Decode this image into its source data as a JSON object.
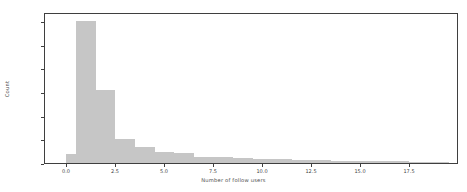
{
  "chart_data": {
    "type": "bar",
    "title": "",
    "subtitle": "",
    "xlabel": "Number of follow users",
    "ylabel": "Count",
    "xlim": [
      -0.95,
      19.8
    ],
    "ylim": [
      0,
      127000
    ],
    "grid": false,
    "legend": null,
    "bin_width": 0.5,
    "bar_color": "#c6c6c6",
    "frame_color": "#3f3f3f",
    "x_ticks": [
      "0.0",
      "2.5",
      "5.0",
      "7.5",
      "10.0",
      "12.5",
      "15.0",
      "17.5"
    ],
    "x_tick_values": [
      0.0,
      2.5,
      5.0,
      7.5,
      10.0,
      12.5,
      15.0,
      17.5
    ],
    "y_ticks": [
      "0",
      "20000",
      "40000",
      "60000",
      "80000",
      "100000",
      "120000"
    ],
    "y_tick_values": [
      0,
      20000,
      40000,
      60000,
      80000,
      100000,
      120000
    ],
    "bins": [
      {
        "x0": 0.0,
        "x1": 0.5,
        "count": 8000
      },
      {
        "x0": 0.5,
        "x1": 1.0,
        "count": 120000
      },
      {
        "x0": 1.0,
        "x1": 1.5,
        "count": 120000
      },
      {
        "x0": 1.5,
        "x1": 2.0,
        "count": 62000
      },
      {
        "x0": 2.0,
        "x1": 2.5,
        "count": 62000
      },
      {
        "x0": 2.5,
        "x1": 3.0,
        "count": 20500
      },
      {
        "x0": 3.0,
        "x1": 3.5,
        "count": 20500
      },
      {
        "x0": 3.5,
        "x1": 4.0,
        "count": 13500
      },
      {
        "x0": 4.0,
        "x1": 4.5,
        "count": 13500
      },
      {
        "x0": 4.5,
        "x1": 5.0,
        "count": 9000
      },
      {
        "x0": 5.0,
        "x1": 5.5,
        "count": 9000
      },
      {
        "x0": 5.5,
        "x1": 6.0,
        "count": 8500
      },
      {
        "x0": 6.0,
        "x1": 6.5,
        "count": 8500
      },
      {
        "x0": 6.5,
        "x1": 7.0,
        "count": 5500
      },
      {
        "x0": 7.0,
        "x1": 7.5,
        "count": 5500
      },
      {
        "x0": 7.5,
        "x1": 8.0,
        "count": 4800
      },
      {
        "x0": 8.0,
        "x1": 8.5,
        "count": 4800
      },
      {
        "x0": 8.5,
        "x1": 9.0,
        "count": 4000
      },
      {
        "x0": 9.0,
        "x1": 9.5,
        "count": 4000
      },
      {
        "x0": 9.5,
        "x1": 10.0,
        "count": 3400
      },
      {
        "x0": 10.0,
        "x1": 10.5,
        "count": 3400
      },
      {
        "x0": 10.5,
        "x1": 11.0,
        "count": 3000
      },
      {
        "x0": 11.0,
        "x1": 11.5,
        "count": 3000
      },
      {
        "x0": 11.5,
        "x1": 12.0,
        "count": 2600
      },
      {
        "x0": 12.0,
        "x1": 12.5,
        "count": 2600
      },
      {
        "x0": 12.5,
        "x1": 13.0,
        "count": 2300
      },
      {
        "x0": 13.0,
        "x1": 13.5,
        "count": 2300
      },
      {
        "x0": 13.5,
        "x1": 14.0,
        "count": 2000
      },
      {
        "x0": 14.0,
        "x1": 14.5,
        "count": 2000
      },
      {
        "x0": 14.5,
        "x1": 15.0,
        "count": 1800
      },
      {
        "x0": 15.0,
        "x1": 15.5,
        "count": 1800
      },
      {
        "x0": 15.5,
        "x1": 16.0,
        "count": 1600
      },
      {
        "x0": 16.0,
        "x1": 16.5,
        "count": 1600
      },
      {
        "x0": 16.5,
        "x1": 17.0,
        "count": 1400
      },
      {
        "x0": 17.0,
        "x1": 17.5,
        "count": 1400
      },
      {
        "x0": 17.5,
        "x1": 18.0,
        "count": 1200
      },
      {
        "x0": 18.0,
        "x1": 18.5,
        "count": 1200
      },
      {
        "x0": 18.5,
        "x1": 19.0,
        "count": 1000
      },
      {
        "x0": 19.0,
        "x1": 19.5,
        "count": 900
      }
    ]
  },
  "artifact": {
    "top_text": ""
  }
}
